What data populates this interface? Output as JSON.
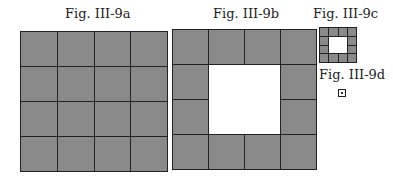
{
  "figures": [
    {
      "label": "Fig. III-9a",
      "size": 4,
      "hole": 0
    },
    {
      "label": "Fig. III-9b",
      "size": 4,
      "hole": 2
    },
    {
      "label": "Fig. III-9c",
      "size": 4,
      "hole": 2
    },
    {
      "label": "Fig. III-9d",
      "size": 1,
      "hole": 0
    }
  ],
  "colors": {
    "cell": "#8a8a8a",
    "line": "#222222",
    "hole": "#ffffff"
  }
}
